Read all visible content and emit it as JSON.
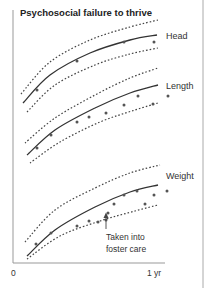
{
  "chart_data": {
    "type": "scatter",
    "title": "Psychosocial failure to thrive",
    "xlabel": "",
    "ylabel": "",
    "x_ticks": [
      "0",
      "1 yr"
    ],
    "grid": false,
    "legend": "none",
    "series": [
      {
        "name": "Head",
        "centile_curves": {
          "upper": [
            [
              21,
              94
            ],
            [
              50,
              62
            ],
            [
              90,
              40
            ],
            [
              130,
              27
            ],
            [
              158,
              20
            ]
          ],
          "median": [
            [
              23,
              103
            ],
            [
              50,
              75
            ],
            [
              90,
              53
            ],
            [
              130,
              40
            ],
            [
              157,
              35
            ]
          ],
          "lower": [
            [
              27,
              112
            ],
            [
              55,
              85
            ],
            [
              95,
              65
            ],
            [
              130,
              54
            ],
            [
              158,
              48
            ]
          ]
        },
        "points": [
          [
            37,
            90
          ],
          [
            77,
            61
          ],
          [
            124,
            42
          ],
          [
            154,
            42
          ]
        ]
      },
      {
        "name": "Length",
        "centile_curves": {
          "upper": [
            [
              25,
              143
            ],
            [
              55,
              118
            ],
            [
              95,
              95
            ],
            [
              130,
              78
            ],
            [
              158,
              68
            ]
          ],
          "median": [
            [
              27,
              155
            ],
            [
              55,
              130
            ],
            [
              95,
              108
            ],
            [
              130,
              93
            ],
            [
              158,
              85
            ]
          ],
          "lower": [
            [
              30,
              163
            ],
            [
              60,
              142
            ],
            [
              100,
              122
            ],
            [
              135,
              110
            ],
            [
              158,
              103
            ]
          ]
        },
        "points": [
          [
            37,
            148
          ],
          [
            51,
            135
          ],
          [
            77,
            122
          ],
          [
            89,
            117
          ],
          [
            106,
            113
          ],
          [
            124,
            105
          ],
          [
            138,
            96
          ],
          [
            153,
            104
          ],
          [
            168,
            96
          ]
        ]
      },
      {
        "name": "Weight",
        "centile_curves": {
          "upper": [
            [
              25,
              242
            ],
            [
              55,
              210
            ],
            [
              95,
              188
            ],
            [
              130,
              173
            ],
            [
              160,
              165
            ]
          ],
          "median": [
            [
              27,
              256
            ],
            [
              55,
              230
            ],
            [
              95,
              207
            ],
            [
              130,
              192
            ],
            [
              158,
              185
            ]
          ],
          "lower": [
            [
              27,
              259
            ],
            [
              60,
              236
            ],
            [
              100,
              221
            ],
            [
              135,
              211
            ],
            [
              158,
              205
            ]
          ]
        },
        "points": [
          [
            36,
            244
          ],
          [
            51,
            233
          ],
          [
            77,
            226
          ],
          [
            89,
            221
          ],
          [
            98,
            222
          ],
          [
            106,
            220
          ],
          [
            108,
            213
          ],
          [
            114,
            204
          ],
          [
            124,
            195
          ],
          [
            137,
            191
          ],
          [
            145,
            204
          ],
          [
            154,
            195
          ],
          [
            167,
            191
          ]
        ]
      }
    ],
    "annotations": [
      {
        "text_lines": [
          "Taken into",
          "foster care"
        ],
        "arrow_to": [
          106,
          212
        ]
      }
    ]
  },
  "labels": {
    "title": "Psychosocial failure to thrive",
    "head": "Head",
    "length": "Length",
    "weight": "Weight",
    "x0": "0",
    "x1": "1 yr",
    "annotation_line1": "Taken into",
    "annotation_line2": "foster care"
  }
}
